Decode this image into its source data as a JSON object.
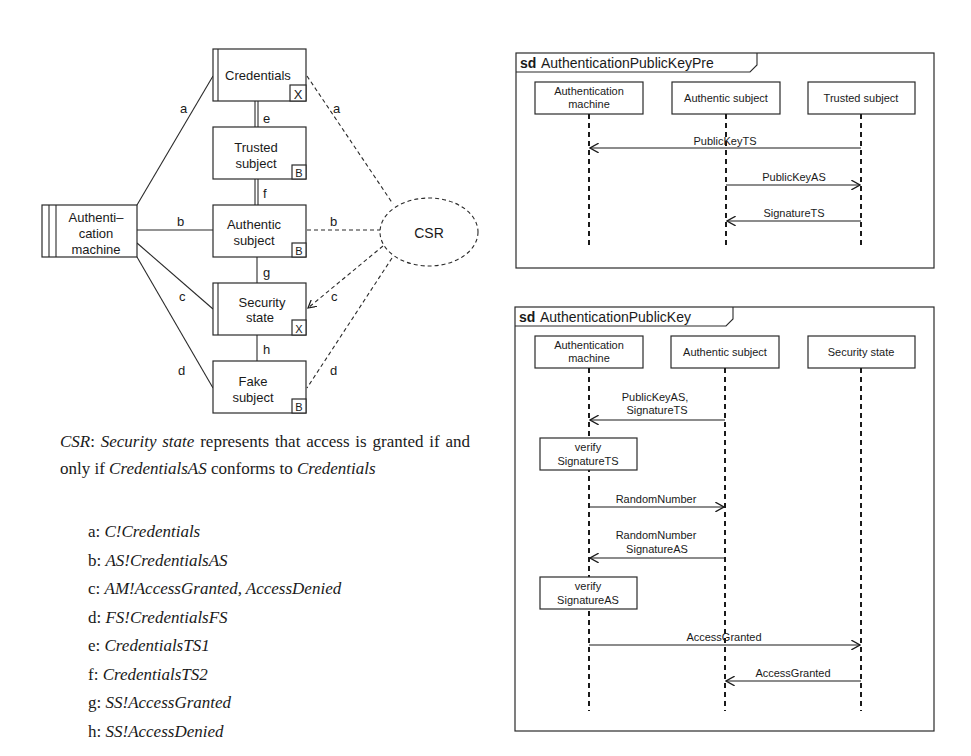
{
  "problem_diagram": {
    "domains": [
      {
        "id": "credentials",
        "label_lines": [
          "Credentials"
        ],
        "marker": "X"
      },
      {
        "id": "trusted-subject",
        "label_lines": [
          "Trusted",
          "subject"
        ],
        "marker": "B"
      },
      {
        "id": "authentic-subject",
        "label_lines": [
          "Authentic",
          "subject"
        ],
        "marker": "B"
      },
      {
        "id": "security-state",
        "label_lines": [
          "Security",
          "state"
        ],
        "marker": "X"
      },
      {
        "id": "fake-subject",
        "label_lines": [
          "Fake",
          "subject"
        ],
        "marker": "B"
      },
      {
        "id": "authentication-machine",
        "label_lines": [
          "Authenti–",
          "cation",
          "machine"
        ]
      }
    ],
    "requirement": "CSR",
    "interface_labels": {
      "a": "a",
      "b": "b",
      "c": "c",
      "d": "d",
      "e": "e",
      "f": "f",
      "g": "g",
      "h": "h"
    }
  },
  "caption": {
    "csr": "CSR",
    "sep": ": ",
    "security_state": "Security state",
    "text1": " represents that access is granted if and only if ",
    "credentials_as": "CredentialsAS",
    "text2": " conforms to ",
    "credentials": "Credentials"
  },
  "legend": [
    {
      "key": "a: ",
      "value": "C!Credentials"
    },
    {
      "key": "b: ",
      "value": "AS!CredentialsAS"
    },
    {
      "key": "c: ",
      "value": "AM!AccessGranted, AccessDenied"
    },
    {
      "key": "d: ",
      "value": "FS!CredentialsFS"
    },
    {
      "key": "e: ",
      "value": "CredentialsTS1"
    },
    {
      "key": "f: ",
      "value": "CredentialsTS2"
    },
    {
      "key": "g: ",
      "value": "SS!AccessGranted"
    },
    {
      "key": "h: ",
      "value": "SS!AccessDenied"
    }
  ],
  "sd1": {
    "keyword": "sd",
    "name": "AuthenticationPublicKeyPre",
    "lifelines": [
      {
        "label_lines": [
          "Authentication",
          "machine"
        ]
      },
      {
        "label_lines": [
          "Authentic subject"
        ]
      },
      {
        "label_lines": [
          "Trusted subject"
        ]
      }
    ],
    "messages": [
      {
        "label": "PublicKeyTS",
        "from": 2,
        "to": 0
      },
      {
        "label": "PublicKeyAS",
        "from": 1,
        "to": 2
      },
      {
        "label": "SignatureTS",
        "from": 2,
        "to": 1
      }
    ]
  },
  "sd2": {
    "keyword": "sd",
    "name": "AuthenticationPublicKey",
    "lifelines": [
      {
        "label_lines": [
          "Authentication",
          "machine"
        ]
      },
      {
        "label_lines": [
          "Authentic subject"
        ]
      },
      {
        "label_lines": [
          "Security state"
        ]
      }
    ],
    "messages": [
      {
        "label_lines": [
          "PublicKeyAS,",
          "SignatureTS"
        ],
        "from": 1,
        "to": 0
      },
      {
        "label_lines": [
          "RandomNumber"
        ],
        "from": 0,
        "to": 1
      },
      {
        "label_lines": [
          "RandomNumber",
          "SignatureAS"
        ],
        "from": 1,
        "to": 0
      },
      {
        "label_lines": [
          "AccessGranted"
        ],
        "from": 0,
        "to": 2
      },
      {
        "label_lines": [
          "AccessGranted"
        ],
        "from": 2,
        "to": 1
      }
    ],
    "actions": [
      {
        "label_lines": [
          "verify",
          "SignatureTS"
        ]
      },
      {
        "label_lines": [
          "verify",
          "SignatureAS"
        ]
      }
    ]
  }
}
